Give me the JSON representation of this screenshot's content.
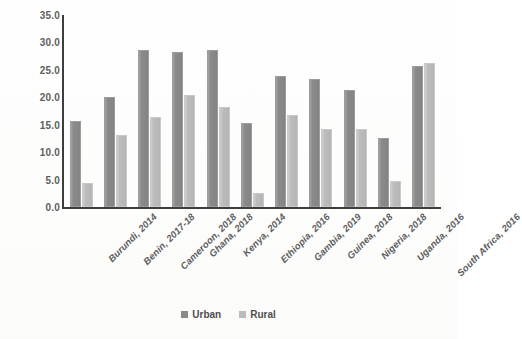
{
  "chart_data": {
    "type": "bar",
    "title": "",
    "subtitle": "",
    "xlabel": "",
    "ylabel": "",
    "ylim": [
      0,
      35
    ],
    "y_ticks": [
      "0.0",
      "5.0",
      "10.0",
      "15.0",
      "20.0",
      "25.0",
      "30.0",
      "35.0"
    ],
    "y_tick_values": [
      0,
      5,
      10,
      15,
      20,
      25,
      30,
      35
    ],
    "grid": false,
    "legend_position": "bottom",
    "categories": [
      "Burundi, 2014",
      "Benin, 2017-18",
      "Cameroon, 2018",
      "Ghana, 2018",
      "Kenya, 2014",
      "Ethiopia, 2016",
      "Gambia, 2019",
      "Guinea, 2018",
      "Nigeria, 2018",
      "Uganda, 2016",
      "South Africa, 2016"
    ],
    "series": [
      {
        "name": "Urban",
        "color": "#8a8a8a",
        "values": [
          15.7,
          20.0,
          28.6,
          28.3,
          28.7,
          15.3,
          23.9,
          23.4,
          21.3,
          12.5,
          25.7
        ]
      },
      {
        "name": "Rural",
        "color": "#bcbcbc",
        "values": [
          4.4,
          13.1,
          16.5,
          20.4,
          18.3,
          2.6,
          16.8,
          14.3,
          14.2,
          4.8,
          26.2
        ]
      }
    ]
  },
  "legend": {
    "items": [
      {
        "label": "Urban",
        "swatch": "legend-swatch-urban"
      },
      {
        "label": "Rural",
        "swatch": "legend-swatch-rural"
      }
    ]
  }
}
